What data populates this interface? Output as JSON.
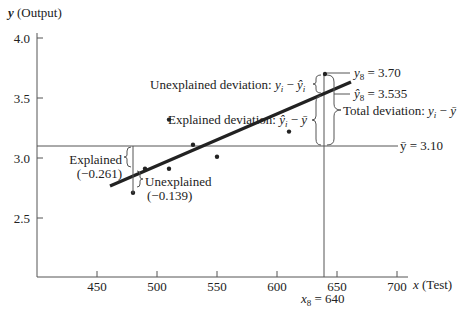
{
  "chart_data": {
    "type": "scatter",
    "title": "",
    "xlabel": "x (Test)",
    "ylabel": "y (Output)",
    "xlim": [
      400,
      712
    ],
    "ylim": [
      2.0,
      4.0
    ],
    "x_ticks": [
      450,
      500,
      550,
      600,
      650,
      700
    ],
    "y_ticks": [
      2.5,
      3.0,
      3.5,
      4.0
    ],
    "x_tick_labels": [
      "450",
      "500",
      "550",
      "600",
      "650",
      "700"
    ],
    "y_tick_labels": [
      "2.5",
      "3.0",
      "3.5",
      "4.0"
    ],
    "series": [
      {
        "name": "Observations",
        "points": [
          {
            "x": 480,
            "y": 2.71
          },
          {
            "x": 490,
            "y": 2.91
          },
          {
            "x": 510,
            "y": 2.91
          },
          {
            "x": 510,
            "y": 3.32
          },
          {
            "x": 530,
            "y": 3.11
          },
          {
            "x": 550,
            "y": 3.01
          },
          {
            "x": 610,
            "y": 3.22
          },
          {
            "x": 640,
            "y": 3.7
          }
        ]
      },
      {
        "name": "Regression line",
        "type": "line",
        "points": [
          {
            "x": 462,
            "y": 2.77
          },
          {
            "x": 662,
            "y": 3.63
          }
        ]
      }
    ],
    "mean_line": {
      "y": 3.1,
      "label": "ȳ = 3.10"
    },
    "highlight": {
      "x": 640,
      "x_label": "x",
      "x_sub": "8",
      "x_value": "= 640"
    },
    "annotations": {
      "y8": {
        "label_var": "y",
        "label_sub": "8",
        "label_val": "= 3.70"
      },
      "yhat8": {
        "label_var": "ŷ",
        "label_sub": "8",
        "label_val": "= 3.535"
      },
      "unexplained_dev": {
        "text": "Unexplained deviation: ",
        "expr_a": "y",
        "expr_a_sub": "i",
        "minus": " − ",
        "expr_b": "ŷ",
        "expr_b_sub": "i"
      },
      "explained_dev": {
        "text": "Explained deviation: ",
        "expr_a": "ŷ",
        "expr_a_sub": "i",
        "minus": " − ",
        "expr_b": "ȳ"
      },
      "total_dev": {
        "text": "Total deviation: ",
        "expr_a": "y",
        "expr_a_sub": "i",
        "minus": " − ",
        "expr_b": "ȳ"
      },
      "explained_small": {
        "line1": "Explained",
        "line2": "(−0.261)"
      },
      "unexplained_small": {
        "line1": "Unexplained",
        "line2": "(−0.139)"
      }
    },
    "legend": null,
    "grid": false
  },
  "axes": {
    "y_label_var": "y",
    "y_label_rest": " (Output)",
    "x_label_var": "x",
    "x_label_rest": " (Test)"
  }
}
